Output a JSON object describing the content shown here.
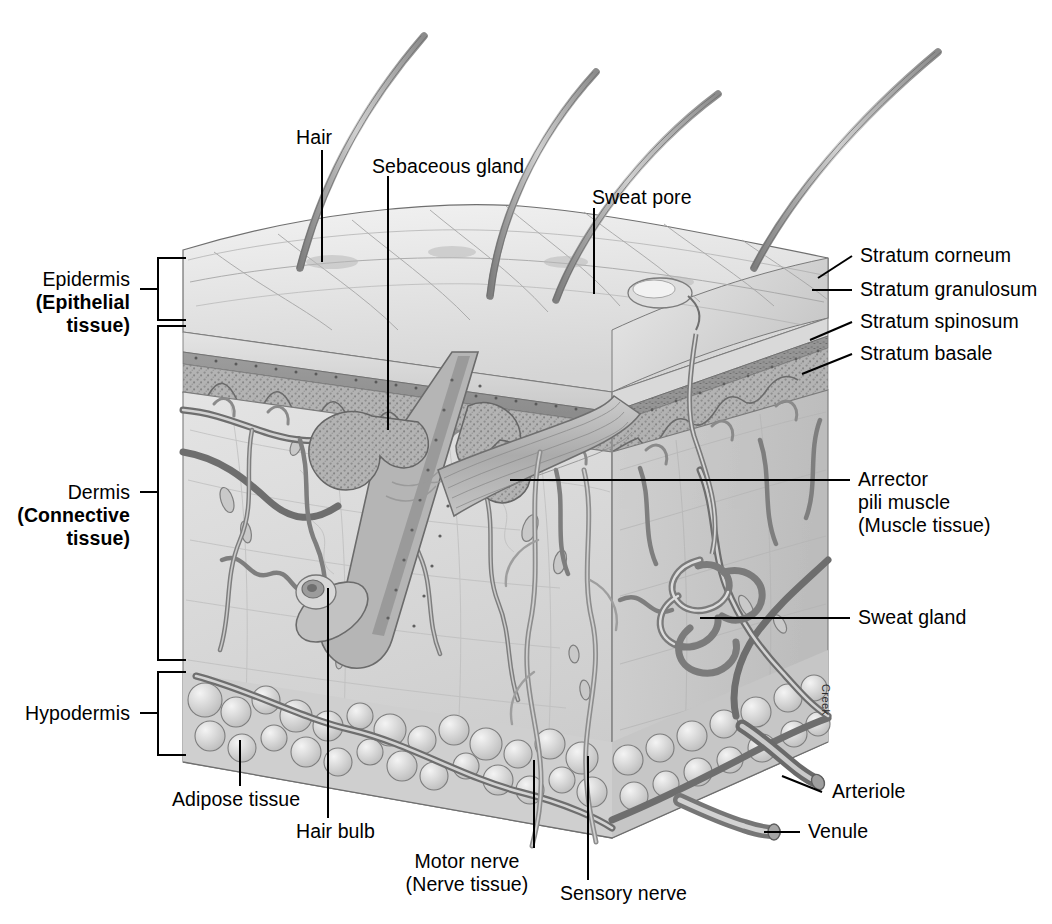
{
  "figure": {
    "credit": "Creek",
    "palette": {
      "ink": "#000000",
      "surface_light": "#e6e6e6",
      "epidermis_band": "#9a9a9a",
      "spinosum": "#b0b0b0",
      "dermis": "#dcdcdc",
      "dermis_side": "#cfcfcf",
      "adipose": "#d2d2d2",
      "vessel_dark": "#6e6e6e",
      "vessel_mid": "#8d8d8d",
      "hair": "#9b9b9b"
    }
  },
  "left_labels": [
    {
      "id": "epidermis",
      "line1": "Epidermis",
      "line2": "(Epithelial",
      "line3": "tissue)"
    },
    {
      "id": "dermis",
      "line1": "Dermis",
      "line2": "(Connective",
      "line3": "tissue)"
    },
    {
      "id": "hypodermis",
      "line1": "Hypodermis",
      "line2": "",
      "line3": ""
    }
  ],
  "top_labels": [
    {
      "id": "hair",
      "text": "Hair"
    },
    {
      "id": "sebaceous-gland",
      "text": "Sebaceous gland"
    },
    {
      "id": "sweat-pore",
      "text": "Sweat pore"
    }
  ],
  "strata": [
    {
      "id": "stratum-corneum",
      "text": "Stratum corneum"
    },
    {
      "id": "stratum-granulosum",
      "text": "Stratum granulosum"
    },
    {
      "id": "stratum-spinosum",
      "text": "Stratum spinosum"
    },
    {
      "id": "stratum-basale",
      "text": "Stratum basale"
    }
  ],
  "right_labels": [
    {
      "id": "arrector-pili",
      "line1": "Arrector",
      "line2": "pili muscle",
      "line3": "(Muscle tissue)"
    },
    {
      "id": "sweat-gland",
      "line1": "Sweat gland",
      "line2": "",
      "line3": ""
    },
    {
      "id": "arteriole",
      "line1": "Arteriole",
      "line2": "",
      "line3": ""
    },
    {
      "id": "venule",
      "line1": "Venule",
      "line2": "",
      "line3": ""
    }
  ],
  "bottom_labels": [
    {
      "id": "adipose-tissue",
      "line1": "Adipose tissue",
      "line2": ""
    },
    {
      "id": "hair-bulb",
      "line1": "Hair bulb",
      "line2": ""
    },
    {
      "id": "motor-nerve",
      "line1": "Motor nerve",
      "line2": "(Nerve tissue)"
    },
    {
      "id": "sensory-nerve",
      "line1": "Sensory nerve",
      "line2": ""
    }
  ]
}
